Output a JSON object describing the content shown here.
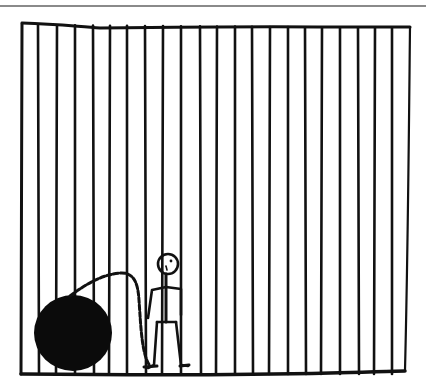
{
  "panel": {
    "description": "Hand-drawn comic panel: a stick figure standing behind prison bars, with a ball and chain attached to his ankle",
    "frame": {
      "left": 22,
      "right": 407,
      "top_left_y": 24,
      "top_right_y": 27,
      "bottom_y": 374
    },
    "bars_x": [
      38,
      57,
      75,
      93,
      110,
      127,
      145,
      163,
      181,
      200,
      217,
      235,
      252,
      270,
      288,
      305,
      322,
      340,
      358,
      375,
      392
    ],
    "ink_color": "#111111",
    "top_rule_color": "#8a8a8a",
    "ball": {
      "cx": 73,
      "cy": 333,
      "rx": 38,
      "ry": 38
    },
    "figure": {
      "head_cx": 168,
      "head_cy": 264,
      "head_r": 10
    }
  }
}
